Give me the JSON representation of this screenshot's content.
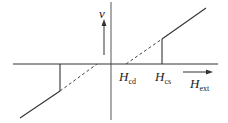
{
  "diagram": {
    "title": "",
    "labels": {
      "v": "v",
      "hcd_main": "H",
      "hcd_sub": "cd",
      "hcs_main": "H",
      "hcs_sub": "cs",
      "hext_main": "H",
      "hext_sub": "ext"
    },
    "colors": {
      "line": "#333333",
      "background": "#ffffff"
    }
  }
}
